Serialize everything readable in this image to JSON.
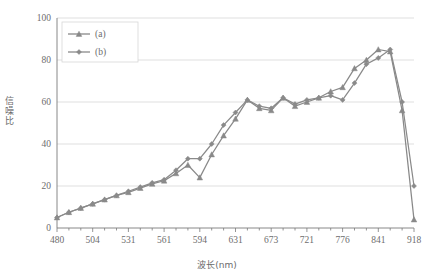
{
  "chart_data": {
    "type": "line",
    "title": "",
    "xlabel": "波长(nm)",
    "ylabel": "信噪比",
    "xlim": [
      0,
      30
    ],
    "ylim": [
      0,
      100
    ],
    "yticks": [
      0,
      20,
      40,
      60,
      80,
      100
    ],
    "grid": true,
    "legend_position": "top-left",
    "x_tick_labels": [
      "480",
      "504",
      "531",
      "561",
      "594",
      "631",
      "673",
      "721",
      "776",
      "841",
      "918"
    ],
    "x_major_indices": [
      0,
      3,
      6,
      9,
      12,
      15,
      18,
      21,
      24,
      27,
      30
    ],
    "x_minor_count": 31,
    "categories": [
      480,
      488,
      496,
      504,
      513,
      522,
      531,
      541,
      551,
      561,
      572,
      583,
      594,
      606,
      618,
      631,
      645,
      659,
      673,
      689,
      705,
      721,
      739,
      757,
      776,
      797,
      819,
      841,
      866,
      891,
      918
    ],
    "series": [
      {
        "name": "(a)",
        "marker": "triangle",
        "color": "#898989",
        "values": [
          5,
          7.5,
          9.5,
          11.5,
          13.5,
          15.5,
          17,
          19,
          21,
          22.5,
          26,
          30,
          24,
          35,
          44,
          52,
          61,
          57,
          56,
          62,
          58,
          60,
          62,
          65,
          67,
          76,
          80,
          85,
          84,
          56,
          4
        ]
      },
      {
        "name": "(b)",
        "marker": "diamond",
        "color": "#8a8a8a",
        "values": [
          5,
          7.5,
          9.5,
          11.5,
          13.5,
          15.5,
          17.5,
          19.5,
          21.5,
          23,
          27.5,
          33,
          33,
          40,
          49,
          55,
          61,
          58,
          57,
          62,
          59,
          61,
          62,
          63,
          61,
          69,
          78,
          81,
          85,
          60,
          20
        ]
      }
    ]
  },
  "legend": {
    "items": [
      {
        "label": "(a)"
      },
      {
        "label": "(b)"
      }
    ]
  },
  "colors": {
    "line": "#898989",
    "grid": "#d7d7d7",
    "axis": "#7a7a7a",
    "text": "#6d6d6d",
    "background": "#ffffff"
  }
}
